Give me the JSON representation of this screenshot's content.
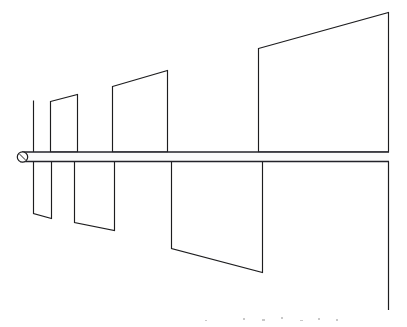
{
  "figure": {
    "canvas": {
      "width": 407,
      "height": 327,
      "background": "#ffffff"
    },
    "ink_color": "#1d1d1f",
    "beam_color": "#23232a",
    "caption_text": ""
  },
  "beam": {
    "name": "horizontal-shaft",
    "x_start": 22,
    "x_end": 389,
    "top_y": 152,
    "bottom_y": 161.5,
    "thickness": 9.5
  },
  "hub": {
    "name": "end-hub",
    "cx": 22.5,
    "cy": 157,
    "r": 5.2,
    "tick_angle_deg": 45
  },
  "tail": {
    "name": "right-end-drop-line",
    "x": 388.5,
    "y_top": 161.5,
    "y_bottom": 310
  },
  "upper_vanes": [
    {
      "id": "upper-vane-1",
      "type": "thin-line",
      "x": 33.5,
      "y_top": 100.5,
      "y_bottom": 152
    },
    {
      "id": "upper-vane-2",
      "type": "quad",
      "points": "50.5,101.5 77.5,94.5 77.5,152 50.5,152",
      "root_left_x": 50.5,
      "root_right_x": 77.5,
      "tip_left_y": 101.5,
      "tip_right_y": 94.5
    },
    {
      "id": "upper-vane-3",
      "type": "quad",
      "points": "112.5,86.5 167.5,70.5 167.5,152 112.5,152",
      "root_left_x": 112.5,
      "root_right_x": 167.5,
      "tip_left_y": 86.5,
      "tip_right_y": 70.5
    },
    {
      "id": "upper-vane-4",
      "type": "quad",
      "points": "258.5,48.5 388.5,12.5 388.5,152 258.5,152",
      "root_left_x": 258.5,
      "root_right_x": 388.5,
      "tip_left_y": 48.5,
      "tip_right_y": 12.5
    }
  ],
  "lower_vanes": [
    {
      "id": "lower-vane-1",
      "type": "quad",
      "points": "33.5,161.5 51.5,161.5 51.5,218.5 33.5,213.5",
      "root_left_x": 33.5,
      "root_right_x": 51.5,
      "tip_left_y": 213.5,
      "tip_right_y": 218.5
    },
    {
      "id": "lower-vane-2",
      "type": "quad",
      "points": "74.5,161.5 114.5,161.5 114.5,230.5 74.5,222.5",
      "root_left_x": 74.5,
      "root_right_x": 114.5,
      "tip_left_y": 222.5,
      "tip_right_y": 230.5
    },
    {
      "id": "lower-vane-3",
      "type": "quad",
      "points": "171.5,161.5 262.5,161.5 262.5,272.5 171.5,248.5",
      "root_left_x": 171.5,
      "root_right_x": 262.5,
      "tip_left_y": 248.5,
      "tip_right_y": 272.5
    }
  ],
  "scan_specks": [
    {
      "x": 243,
      "y": 318,
      "w": 2,
      "h": 2
    },
    {
      "x": 262,
      "y": 319,
      "w": 3,
      "h": 2
    },
    {
      "x": 281,
      "y": 317,
      "w": 2,
      "h": 2
    },
    {
      "x": 300,
      "y": 320,
      "w": 3,
      "h": 1
    },
    {
      "x": 318,
      "y": 318,
      "w": 2,
      "h": 2
    },
    {
      "x": 336,
      "y": 319,
      "w": 2,
      "h": 2
    },
    {
      "x": 205,
      "y": 320,
      "w": 2,
      "h": 1
    }
  ]
}
